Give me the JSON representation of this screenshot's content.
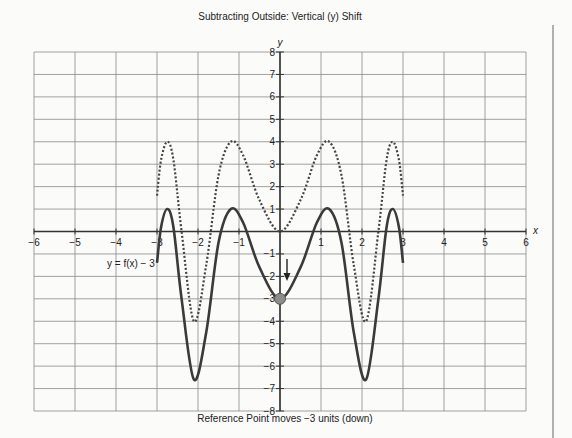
{
  "chart_data": {
    "type": "line",
    "title": "Subtracting Outside: Vertical (y) Shift",
    "xlabel": "x",
    "ylabel": "y",
    "xlim": [
      -6,
      6
    ],
    "ylim": [
      -8,
      8
    ],
    "grid": true,
    "x_ticks": [
      -6,
      -5,
      -4,
      -3,
      -2,
      -1,
      1,
      2,
      3,
      4,
      5,
      6
    ],
    "y_ticks": [
      -8,
      -7,
      -6,
      -5,
      -4,
      -3,
      -2,
      -1,
      1,
      2,
      3,
      4,
      5,
      6,
      7,
      8
    ],
    "series": [
      {
        "name": "f(x)",
        "style": "dotted",
        "points": [
          [
            -3,
            1.6
          ],
          [
            -2.9,
            3.2
          ],
          [
            -2.75,
            4
          ],
          [
            -2.6,
            3.2
          ],
          [
            -2.4,
            0
          ],
          [
            -2.1,
            -4
          ],
          [
            -1.8,
            -1.5
          ],
          [
            -1.5,
            2.5
          ],
          [
            -1.2,
            4
          ],
          [
            -0.9,
            3.4
          ],
          [
            -0.5,
            1.4
          ],
          [
            0,
            0
          ],
          [
            0.5,
            1.4
          ],
          [
            0.9,
            3.4
          ],
          [
            1.2,
            4
          ],
          [
            1.5,
            2.5
          ],
          [
            1.8,
            -1.5
          ],
          [
            2.1,
            -4
          ],
          [
            2.4,
            0
          ],
          [
            2.6,
            3.2
          ],
          [
            2.75,
            4
          ],
          [
            2.9,
            3.2
          ],
          [
            3,
            1.6
          ]
        ]
      },
      {
        "name": "y = f(x) - 3",
        "style": "solid",
        "points": [
          [
            -3,
            -1.4
          ],
          [
            -2.9,
            0.2
          ],
          [
            -2.75,
            1
          ],
          [
            -2.6,
            0.2
          ],
          [
            -2.4,
            -3
          ],
          [
            -2.1,
            -6.6
          ],
          [
            -1.8,
            -4.5
          ],
          [
            -1.5,
            -0.5
          ],
          [
            -1.2,
            1
          ],
          [
            -0.9,
            0.4
          ],
          [
            -0.5,
            -1.6
          ],
          [
            0,
            -3
          ],
          [
            0.5,
            -1.6
          ],
          [
            0.9,
            0.4
          ],
          [
            1.2,
            1
          ],
          [
            1.5,
            -0.5
          ],
          [
            1.8,
            -4.5
          ],
          [
            2.1,
            -6.6
          ],
          [
            2.4,
            -3
          ],
          [
            2.6,
            0.2
          ],
          [
            2.75,
            1
          ],
          [
            2.9,
            0.2
          ],
          [
            3,
            -1.4
          ]
        ]
      }
    ],
    "reference_point": {
      "x": 0,
      "y": -3
    },
    "annotations": [
      {
        "text": "y = f(x) − 3",
        "x": -4.2,
        "y": -1.7
      },
      {
        "text": "Reference Point moves −3 units (down)",
        "position": "below-chart"
      }
    ]
  },
  "labels": {
    "title": "Subtracting Outside: Vertical (y) Shift",
    "curve_label": "y = f(x) − 3",
    "caption": "Reference Point moves −3 units (down)",
    "x_axis": "x",
    "y_axis": "y"
  },
  "colors": {
    "grid": "#8a8a8a",
    "axis": "#333333",
    "curve": "#3a3a3a",
    "dotted": "#444444",
    "point_fill": "#8c8c8c",
    "point_stroke": "#555555",
    "background": "#fbfbfa"
  }
}
